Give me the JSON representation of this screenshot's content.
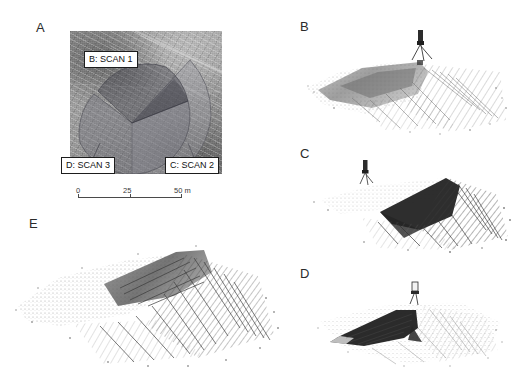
{
  "figure": {
    "panels": [
      {
        "id": "A",
        "letter": "A",
        "caption_type": "aerial-photo-with-scan-coverage"
      },
      {
        "id": "B",
        "letter": "B",
        "caption_type": "point-cloud-scan-1"
      },
      {
        "id": "C",
        "letter": "C",
        "caption_type": "point-cloud-scan-2"
      },
      {
        "id": "D",
        "letter": "D",
        "caption_type": "point-cloud-scan-3"
      },
      {
        "id": "E",
        "letter": "E",
        "caption_type": "point-cloud-merged"
      }
    ]
  },
  "panel_a": {
    "letter": "A",
    "callouts": [
      {
        "id": "scan1",
        "label": "B: SCAN 1"
      },
      {
        "id": "scan3",
        "label": "D: SCAN 3"
      },
      {
        "id": "scan2",
        "label": "C: SCAN 2"
      }
    ],
    "scalebar": {
      "ticks": [
        "0",
        "25",
        "50 m"
      ],
      "start_value": "0",
      "mid_value": "25",
      "end_value": "50 m",
      "units": "m"
    },
    "sectors": [
      {
        "name": "scan-1-coverage",
        "fill": "#6f6f78",
        "opacity": 0.38
      },
      {
        "name": "scan-2-coverage",
        "fill": "#9a9aa2",
        "opacity": 0.42
      },
      {
        "name": "scan-3-coverage",
        "fill": "#4e4e58",
        "opacity": 0.45
      }
    ]
  },
  "panel_b": {
    "letter": "B",
    "scanner_marker": "scanner-tripod"
  },
  "panel_c": {
    "letter": "C",
    "scanner_marker": "scanner-tripod"
  },
  "panel_d": {
    "letter": "D",
    "scanner_marker": "scanner-tripod"
  },
  "panel_e": {
    "letter": "E"
  },
  "colors": {
    "ink": "#2b2b2b",
    "callout_border": "#1d1d1d",
    "callout_bg": "#ffffff",
    "scalebar": "#4a4a4a",
    "cloud_dark": "#2e2e2e",
    "cloud_mid": "#6b6b6b",
    "cloud_light": "#a8a8a8"
  }
}
